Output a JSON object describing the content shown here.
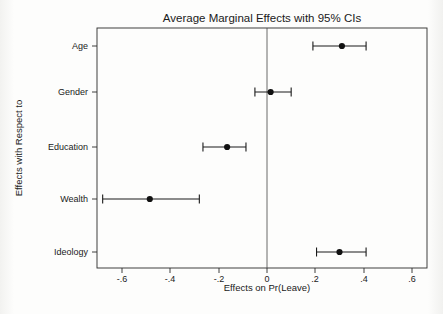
{
  "chart_data": {
    "type": "scatter",
    "title": "Average Marginal Effects with 95% CIs",
    "xlabel": "Effects on Pr(Leave)",
    "ylabel": "Effects with Respect to",
    "orientation": "horizontal",
    "grid": false,
    "legend": null,
    "xlim": [
      -0.7,
      0.65
    ],
    "xticks": [
      -0.6,
      -0.4,
      -0.2,
      0,
      0.2,
      0.4,
      0.6
    ],
    "xticklabels": [
      "-.6",
      "-.4",
      "-.2",
      "0",
      ".2",
      ".4",
      ".6"
    ],
    "categories": [
      "Age",
      "Gender",
      "Education",
      "Wealth",
      "Ideology"
    ],
    "values": [
      0.31,
      0.015,
      -0.165,
      -0.485,
      0.3
    ],
    "ci_lower": [
      0.19,
      -0.05,
      -0.265,
      -0.68,
      0.205
    ],
    "ci_upper": [
      0.41,
      0.1,
      -0.087,
      -0.28,
      0.41
    ],
    "reference_line": 0,
    "marker": "filled-circle",
    "marker_color": "#111111",
    "line_color": "#1a1a1a"
  },
  "figure": {
    "background": "#ffffff",
    "frame_color": "#2b2b2b"
  }
}
